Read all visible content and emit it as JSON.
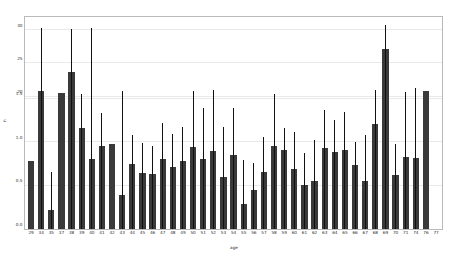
{
  "chart_data": {
    "type": "bar",
    "title": "",
    "xlabel": "age",
    "ylabel": "n",
    "grid": true,
    "legend": null,
    "ylim": [
      0,
      32
    ],
    "y_ticks_upper": [
      20,
      25,
      30
    ],
    "y_ticks_lower": [
      "0.0",
      "0.5",
      "1.0",
      "1.5"
    ],
    "y_tick_labels": [
      "0.0",
      "0.5",
      "1.0",
      "1.5",
      "20",
      "25",
      "30"
    ],
    "note_axis": "Two overlapping y tick label sets are rendered on the axis: a 0.0-1.5 set in the lower half and a 20/25/30 set in the upper half.",
    "error_bars": true,
    "categories": [
      "29",
      "34",
      "35",
      "37",
      "38",
      "39",
      "40",
      "41",
      "42",
      "43",
      "44",
      "45",
      "46",
      "47",
      "48",
      "49",
      "50",
      "51",
      "52",
      "53",
      "54",
      "55",
      "56",
      "57",
      "58",
      "59",
      "60",
      "61",
      "62",
      "63",
      "64",
      "65",
      "66",
      "67",
      "68",
      "69",
      "70",
      "71",
      "74",
      "76",
      "77"
    ],
    "values": [
      10.3,
      20.8,
      2.9,
      20.6,
      23.7,
      15.2,
      10.5,
      12.6,
      12.8,
      5.1,
      9.8,
      8.5,
      8.3,
      10.5,
      9.4,
      10.3,
      12.4,
      10.6,
      11.8,
      7.9,
      11.2,
      3.8,
      5.9,
      8.6,
      12.6,
      12.0,
      9.0,
      6.6,
      7.3,
      12.3,
      11.7,
      12.0,
      9.6,
      7.3,
      15.8,
      27.2,
      8.2,
      10.8,
      10.7,
      20.9,
      0
    ],
    "error_high": [
      10.3,
      30.4,
      8.6,
      20.6,
      30.2,
      20.4,
      30.4,
      17.5,
      12.8,
      20.9,
      14.2,
      13.0,
      12.5,
      16.0,
      14.3,
      15.4,
      20.9,
      18.2,
      21.0,
      15.4,
      18.2,
      10.4,
      10.0,
      13.9,
      20.4,
      15.3,
      14.7,
      11.4,
      13.5,
      18.0,
      16.4,
      17.7,
      13.2,
      14.2,
      21.0,
      30.8,
      12.8,
      20.7,
      21.3,
      20.9,
      0
    ],
    "bar_color": "#3a3a3a",
    "error_color": "#111111",
    "grid_color": "#e9e9e9",
    "frame_color": "#b9b9b9",
    "background": "#ffffff"
  }
}
